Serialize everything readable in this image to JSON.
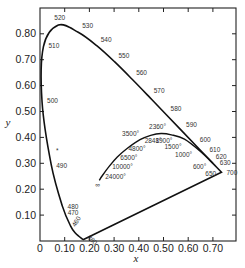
{
  "chart_data": {
    "type": "line",
    "title": "",
    "xlabel": "x",
    "ylabel": "y",
    "xlim": [
      0,
      0.79
    ],
    "ylim": [
      0,
      0.89
    ],
    "grid": false,
    "legend": null,
    "x_ticks": [
      "0",
      "0.10",
      "0.20",
      "0.30",
      "0.40",
      "0.50",
      "0.60",
      "0.70"
    ],
    "y_ticks": [
      "0.10",
      "0.20",
      "0.30",
      "0.40",
      "0.50",
      "0.60",
      "0.70",
      "0.80"
    ],
    "series": [
      {
        "name": "Spectral locus (wavelength, nm)",
        "points": [
          {
            "label": "380",
            "x": 0.1741,
            "y": 0.005
          },
          {
            "label": "460",
            "x": 0.144,
            "y": 0.0297
          },
          {
            "label": "470",
            "x": 0.1241,
            "y": 0.0578
          },
          {
            "label": "480",
            "x": 0.0913,
            "y": 0.1327
          },
          {
            "label": "490",
            "x": 0.0454,
            "y": 0.295
          },
          {
            "label": "500",
            "x": 0.0082,
            "y": 0.5384
          },
          {
            "label": "510",
            "x": 0.0139,
            "y": 0.7502
          },
          {
            "label": "520",
            "x": 0.0743,
            "y": 0.8338
          },
          {
            "label": "530",
            "x": 0.1547,
            "y": 0.8059
          },
          {
            "label": "540",
            "x": 0.2296,
            "y": 0.7543
          },
          {
            "label": "550",
            "x": 0.3016,
            "y": 0.6923
          },
          {
            "label": "560",
            "x": 0.3731,
            "y": 0.6245
          },
          {
            "label": "570",
            "x": 0.4441,
            "y": 0.5547
          },
          {
            "label": "580",
            "x": 0.5125,
            "y": 0.4866
          },
          {
            "label": "590",
            "x": 0.5752,
            "y": 0.4242
          },
          {
            "label": "600",
            "x": 0.627,
            "y": 0.3725
          },
          {
            "label": "610",
            "x": 0.6658,
            "y": 0.334
          },
          {
            "label": "620",
            "x": 0.6915,
            "y": 0.3083
          },
          {
            "label": "630",
            "x": 0.7079,
            "y": 0.292
          },
          {
            "label": "650",
            "x": 0.726,
            "y": 0.274
          },
          {
            "label": "700",
            "x": 0.7347,
            "y": 0.2653
          }
        ]
      },
      {
        "name": "Planckian locus (color temperature, K)",
        "points": [
          {
            "label": "∞",
            "x": 0.24,
            "y": 0.234
          },
          {
            "label": "24000°",
            "x": 0.252,
            "y": 0.252
          },
          {
            "label": "10000°",
            "x": 0.28,
            "y": 0.288
          },
          {
            "label": "6500°",
            "x": 0.313,
            "y": 0.324
          },
          {
            "label": "4800°",
            "x": 0.35,
            "y": 0.355
          },
          {
            "label": "3500°",
            "x": 0.405,
            "y": 0.391
          },
          {
            "label": "2848°",
            "x": 0.448,
            "y": 0.408
          },
          {
            "label": "2360°",
            "x": 0.49,
            "y": 0.415
          },
          {
            "label": "1900°",
            "x": 0.532,
            "y": 0.41
          },
          {
            "label": "1500°",
            "x": 0.585,
            "y": 0.393
          },
          {
            "label": "1000°",
            "x": 0.652,
            "y": 0.344
          },
          {
            "label": "600°",
            "x": 0.7,
            "y": 0.3
          }
        ]
      }
    ],
    "annotations": [
      {
        "text": "*",
        "x": 0.07,
        "y": 0.35
      }
    ]
  }
}
